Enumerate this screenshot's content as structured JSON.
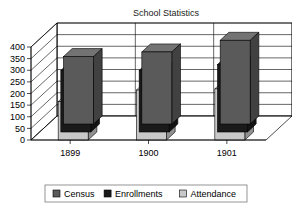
{
  "chart_data": {
    "type": "bar",
    "title": "School Statistics",
    "xlabel": "",
    "ylabel": "",
    "categories": [
      "1899",
      "1900",
      "1901"
    ],
    "series": [
      {
        "name": "Census",
        "values": [
          290,
          310,
          360
        ],
        "color": "#5a5a5a"
      },
      {
        "name": "Enrollments",
        "values": [
          265,
          265,
          290
        ],
        "color": "#1a1a1a"
      },
      {
        "name": "Attendance",
        "values": [
          165,
          215,
          220
        ],
        "color": "#c8c8c8"
      }
    ],
    "ylim": [
      0,
      400
    ],
    "yticks": [
      0,
      50,
      100,
      150,
      200,
      250,
      300,
      350,
      400
    ],
    "ytick_labels": [
      "0",
      "50",
      "100",
      "150",
      "200",
      "250",
      "300",
      "350",
      "400"
    ],
    "grid": true,
    "legend_position": "bottom",
    "projection": "3d"
  },
  "legend": {
    "items": [
      {
        "label": "Census",
        "swatch": "#5a5a5a"
      },
      {
        "label": "Enrollments",
        "swatch": "#1a1a1a"
      },
      {
        "label": "Attendance",
        "swatch": "#c8c8c8"
      }
    ]
  }
}
